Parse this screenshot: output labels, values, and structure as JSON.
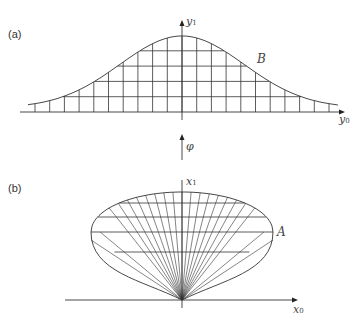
{
  "panel_a": {
    "label": "(a)",
    "y_axis": "y",
    "y_axis_sub": "1",
    "x_axis": "y",
    "x_axis_sub": "0",
    "curve_label": "B",
    "origin": [
      182,
      112
    ],
    "peak_height": 76,
    "curve_sigma": 62,
    "curve_xrange": [
      28,
      338
    ],
    "grid_dx": 14.7,
    "grid_dy": 15.3
  },
  "arrow_label": "φ",
  "panel_b": {
    "label": "(b)",
    "y_axis": "x",
    "y_axis_sub": "1",
    "x_axis": "x",
    "x_axis_sub": "0",
    "curve_label": "A",
    "origin": [
      182,
      300
    ],
    "rays": 21,
    "horizontal_lines_y": [
      203,
      217,
      232,
      252
    ]
  },
  "colors": {
    "line": "#333333",
    "text": "#444444"
  }
}
